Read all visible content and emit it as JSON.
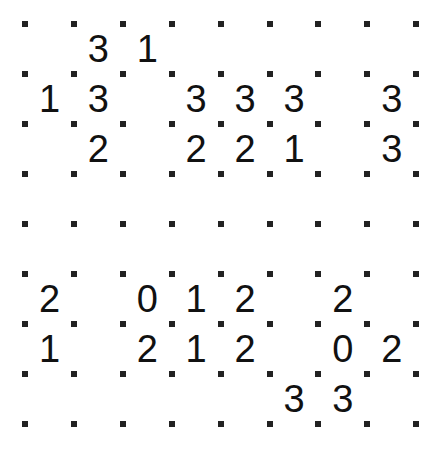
{
  "puzzle": {
    "type": "slitherlink",
    "rows": 8,
    "cols": 8,
    "origin_x": 25,
    "origin_y": 24,
    "step_x": 48.9,
    "step_y": 50,
    "dot_color": "#222222",
    "clue_color": "#111111",
    "clues": [
      [
        "",
        "3",
        "1",
        "",
        "",
        "",
        "",
        ""
      ],
      [
        "1",
        "3",
        "",
        "3",
        "3",
        "3",
        "",
        "3"
      ],
      [
        "",
        "2",
        "",
        "2",
        "2",
        "1",
        "",
        "3"
      ],
      [
        "",
        "",
        "",
        "",
        "",
        "",
        "",
        ""
      ],
      [
        "",
        "",
        "",
        "",
        "",
        "",
        "",
        ""
      ],
      [
        "2",
        "",
        "0",
        "1",
        "2",
        "",
        "2",
        ""
      ],
      [
        "1",
        "",
        "2",
        "1",
        "2",
        "",
        "0",
        "2"
      ],
      [
        "",
        "",
        "",
        "",
        "",
        "3",
        "3",
        ""
      ]
    ]
  }
}
